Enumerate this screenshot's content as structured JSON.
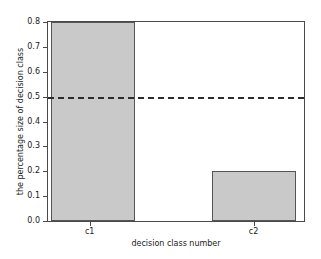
{
  "chart_data": {
    "type": "bar",
    "title": "",
    "subtitle": "",
    "xlabel": "decision class number",
    "ylabel": "the percentage size of decision class",
    "categories": [
      "c1",
      "c2"
    ],
    "values": [
      0.8,
      0.2
    ],
    "series": [
      {
        "name": "the percentage size of decision class",
        "values": [
          0.8,
          0.2
        ]
      }
    ],
    "ylim": [
      0.0,
      0.8
    ],
    "yticks": [
      "0.0",
      "0.1",
      "0.2",
      "0.3",
      "0.4",
      "0.5",
      "0.6",
      "0.7",
      "0.8"
    ],
    "ytick_values": [
      0.0,
      0.1,
      0.2,
      0.3,
      0.4,
      0.5,
      0.6,
      0.7,
      0.8
    ],
    "xticks": [
      "c1",
      "c2"
    ],
    "grid": false,
    "legend": "none",
    "annotations": [
      {
        "name": "threshold-line",
        "kind": "horizontal-dashed-line",
        "value": 0.5,
        "label": ""
      }
    ],
    "bar_fill_color": "#c9c9c9",
    "bar_edge_color": "#555555",
    "threshold_line_color": "#2b2b2b",
    "axis_color": "#4a4a4a",
    "background_color": "#ffffff",
    "bars": [
      {
        "category": "c1",
        "value": 0.8,
        "left_pct": 1.2,
        "width_pct": 32.6
      },
      {
        "category": "c2",
        "value": 0.2,
        "left_pct": 63.9,
        "width_pct": 32.9
      }
    ]
  }
}
